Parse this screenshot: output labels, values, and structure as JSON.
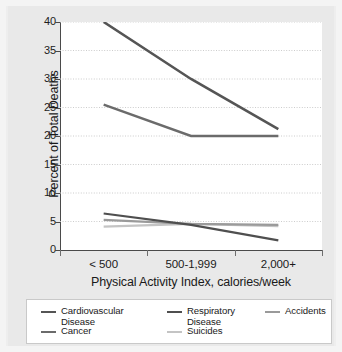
{
  "figure": {
    "background_color": "#e9e9e9",
    "plot_background_color": "#ffffff",
    "axis_color": "#4a4a4a",
    "grid_color": "#c6c6c6"
  },
  "chart_data": {
    "type": "line",
    "title": "",
    "xlabel": "Physical Activity Index, calories/week",
    "ylabel": "Percent of Total Deaths",
    "categories": [
      "< 500",
      "500-1,999",
      "2,000+"
    ],
    "ylim": [
      0,
      40
    ],
    "yticks": [
      0,
      5,
      10,
      15,
      20,
      25,
      30,
      35,
      40
    ],
    "ytick_labels": [
      "0",
      "5",
      "10",
      "15",
      "20",
      "25",
      "30",
      "35",
      "40"
    ],
    "grid": "horizontal-dotted",
    "legend_position": "bottom",
    "series": [
      {
        "name": "Cardiovascular Disease",
        "legend_label": "Cardiovascular\nDisease",
        "color": "#555555",
        "width": 2.6,
        "values": [
          40.0,
          30.0,
          21.2
        ]
      },
      {
        "name": "Cancer",
        "legend_label": "Cancer",
        "color": "#6b6b6b",
        "width": 2.4,
        "values": [
          25.5,
          20.0,
          20.0
        ]
      },
      {
        "name": "Respiratory Disease",
        "legend_label": "Respiratory\nDisease",
        "color": "#4f4f4f",
        "width": 2.2,
        "values": [
          6.4,
          4.4,
          1.7
        ]
      },
      {
        "name": "Accidents",
        "legend_label": "Accidents",
        "color": "#9a9a9a",
        "width": 2.2,
        "values": [
          5.3,
          4.6,
          4.4
        ]
      },
      {
        "name": "Suicides",
        "legend_label": "Suicides",
        "color": "#c4c4c4",
        "width": 2.2,
        "values": [
          4.1,
          4.6,
          4.2
        ]
      }
    ]
  }
}
